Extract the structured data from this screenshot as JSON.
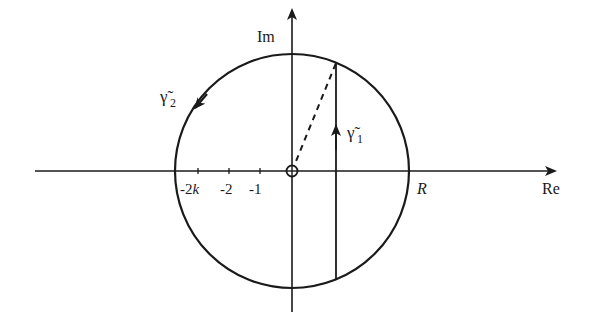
{
  "diagram": {
    "axes": {
      "x_label": "Re",
      "y_label": "Im"
    },
    "ticks": [
      {
        "label": "-2k",
        "x": 210
      },
      {
        "label": "-2",
        "x": 237
      },
      {
        "label": "-1",
        "x": 262
      }
    ],
    "radius_label": "R",
    "contours": [
      {
        "name": "gamma1",
        "label": "γ̃",
        "subscript": "1",
        "description": "vertical segment upward"
      },
      {
        "name": "gamma2",
        "label": "γ̃",
        "subscript": "2",
        "description": "circular arc counter-clockwise"
      }
    ],
    "origin_marker": "circled cross at origin",
    "colors": {
      "ink": "#1a1a1a",
      "background": "#ffffff"
    }
  }
}
